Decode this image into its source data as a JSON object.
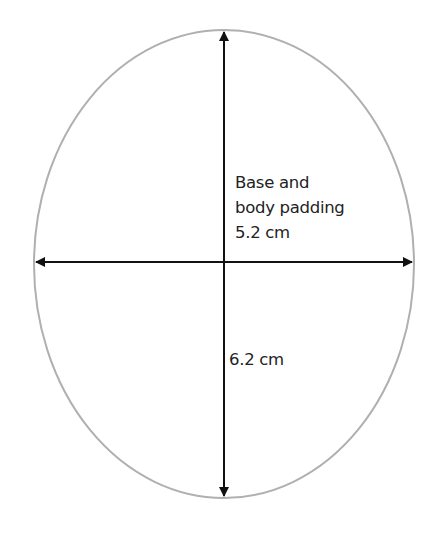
{
  "diagram": {
    "shape": "ellipse",
    "outline_color": "#b0b0b0",
    "arrow_color": "#111111",
    "ellipse": {
      "cx": 224,
      "cy": 264,
      "rx": 190,
      "ry": 234
    },
    "horizontal_dimension": {
      "label_line1": "Base and",
      "label_line2": "body padding",
      "label_line3": "5.2 cm"
    },
    "vertical_dimension": {
      "label": "6.2 cm"
    }
  }
}
